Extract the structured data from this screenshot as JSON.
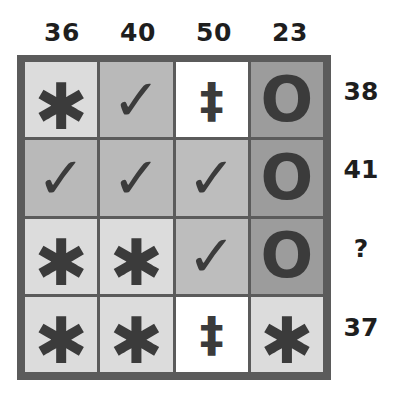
{
  "puzzle": {
    "column_sums": [
      "36",
      "40",
      "50",
      "23"
    ],
    "row_sums": [
      "38",
      "41",
      "?",
      "37"
    ],
    "symbols": {
      "asterisk": {
        "glyph": "✱",
        "icon": "asterisk-icon"
      },
      "check": {
        "glyph": "✓",
        "icon": "check-icon"
      },
      "double-dagger": {
        "glyph": "‡",
        "icon": "double-dagger-icon"
      },
      "o": {
        "glyph": "O",
        "icon": "circle-o-icon"
      }
    },
    "grid": [
      [
        {
          "symbol": "asterisk",
          "glyph": "✱",
          "bg": "#dcdcdc"
        },
        {
          "symbol": "check",
          "glyph": "✓",
          "bg": "#b9b9b9"
        },
        {
          "symbol": "double-dagger",
          "glyph": "‡",
          "bg": "#ffffff"
        },
        {
          "symbol": "o",
          "glyph": "O",
          "bg": "#9c9c9c"
        }
      ],
      [
        {
          "symbol": "check",
          "glyph": "✓",
          "bg": "#b9b9b9"
        },
        {
          "symbol": "check",
          "glyph": "✓",
          "bg": "#b9b9b9"
        },
        {
          "symbol": "check",
          "glyph": "✓",
          "bg": "#bdbdbd"
        },
        {
          "symbol": "o",
          "glyph": "O",
          "bg": "#9c9c9c"
        }
      ],
      [
        {
          "symbol": "asterisk",
          "glyph": "✱",
          "bg": "#dcdcdc"
        },
        {
          "symbol": "asterisk",
          "glyph": "✱",
          "bg": "#dcdcdc"
        },
        {
          "symbol": "check",
          "glyph": "✓",
          "bg": "#bdbdbd"
        },
        {
          "symbol": "o",
          "glyph": "O",
          "bg": "#9c9c9c"
        }
      ],
      [
        {
          "symbol": "asterisk",
          "glyph": "✱",
          "bg": "#dcdcdc"
        },
        {
          "symbol": "asterisk",
          "glyph": "✱",
          "bg": "#dcdcdc"
        },
        {
          "symbol": "double-dagger",
          "glyph": "‡",
          "bg": "#ffffff"
        },
        {
          "symbol": "asterisk",
          "glyph": "✱",
          "bg": "#dcdcdc"
        }
      ]
    ],
    "colors": {
      "frame": "#5b5b5b",
      "symbol": "#3b3b3b",
      "label": "#1e1e1e"
    }
  }
}
